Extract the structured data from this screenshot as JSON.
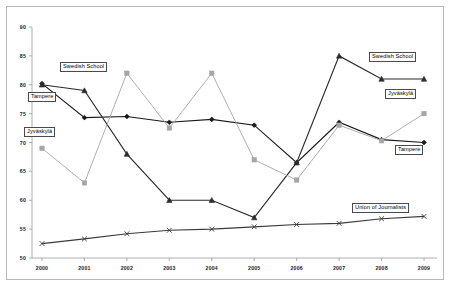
{
  "chart_data": {
    "type": "line",
    "title": "",
    "xlabel": "",
    "ylabel": "",
    "categories": [
      "2000",
      "2001",
      "2002",
      "2003",
      "2004",
      "2005",
      "2006",
      "2007",
      "2008",
      "2009"
    ],
    "ylim": [
      50,
      90
    ],
    "ytick_step": 5,
    "yticks": [
      50,
      55,
      60,
      65,
      70,
      75,
      80,
      85,
      90
    ],
    "grid": false,
    "legend_position": "inline-callout-labels",
    "series": [
      {
        "name": "Tampere",
        "marker": "diamond",
        "color": "#1a1a1a",
        "values": [
          80.2,
          74.3,
          74.5,
          73.5,
          74.0,
          73.0,
          66.5,
          73.5,
          70.5,
          70.0
        ]
      },
      {
        "name": "Swedish School",
        "marker": "triangle",
        "color": "#2b2b2b",
        "values": [
          80.0,
          79.0,
          68.0,
          60.0,
          60.0,
          57.0,
          66.5,
          85.0,
          81.0,
          81.0
        ]
      },
      {
        "name": "Jyväskylä",
        "marker": "square",
        "color": "#a6a6a6",
        "values": [
          69.0,
          63.0,
          82.0,
          72.5,
          82.0,
          67.0,
          63.5,
          73.0,
          70.3,
          75.0
        ]
      },
      {
        "name": "Union of Journalists",
        "marker": "cross",
        "color": "#3a3a3a",
        "values": [
          52.5,
          53.3,
          54.2,
          54.8,
          55.0,
          55.4,
          55.8,
          56.0,
          56.8,
          57.2
        ]
      }
    ],
    "annotations": [
      {
        "text": "Swedish School",
        "x": 60,
        "y": 62
      },
      {
        "text": "Tampere",
        "x": 28,
        "y": 92
      },
      {
        "text": "Jyväskylä",
        "x": 24,
        "y": 127
      },
      {
        "text": "Swedish School",
        "x": 369,
        "y": 52
      },
      {
        "text": "Jyväskylä",
        "x": 385,
        "y": 89
      },
      {
        "text": "Tampere",
        "x": 395,
        "y": 145
      },
      {
        "text": "Union of Journalists",
        "x": 352,
        "y": 203
      }
    ]
  }
}
